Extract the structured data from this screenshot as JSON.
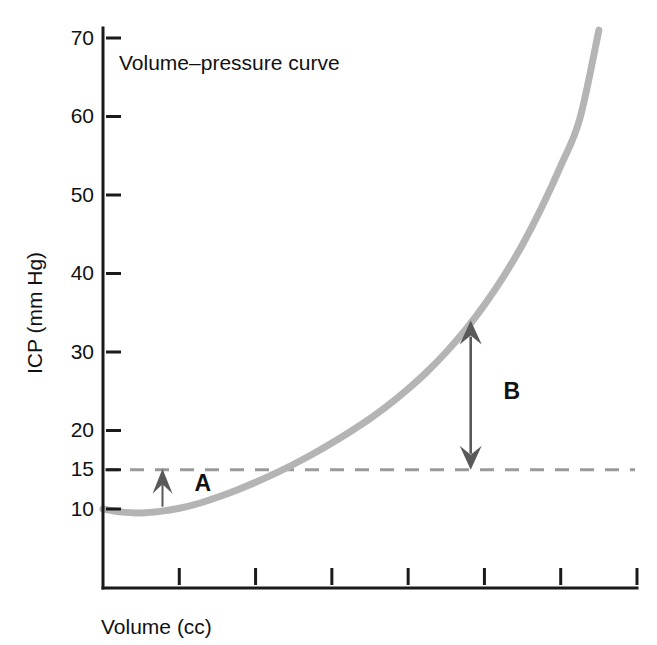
{
  "chart_data": {
    "type": "line",
    "title": "Volume–pressure curve",
    "xlabel": "Volume (cc)",
    "ylabel": "ICP (mm Hg)",
    "grid": false,
    "legend": "none",
    "xlim": [
      0,
      7
    ],
    "ylim": [
      5,
      72
    ],
    "ytick_labels": [
      "70",
      "60",
      "50",
      "40",
      "30",
      "20",
      "15",
      "10"
    ],
    "ytick_values": [
      70,
      60,
      50,
      40,
      30,
      20,
      15,
      10
    ],
    "xtick_labels": [
      "",
      "",
      "",
      "",
      "",
      "",
      ""
    ],
    "xtick_values": [
      1,
      2,
      3,
      4,
      5,
      6,
      7
    ],
    "series": [
      {
        "name": "Volume-pressure curve",
        "color": "#b4b4b4",
        "linewidth": 7,
        "x": [
          0.0,
          0.25,
          0.5,
          0.75,
          1.0,
          1.25,
          1.5,
          1.75,
          2.0,
          2.25,
          2.5,
          2.75,
          3.0,
          3.25,
          3.5,
          3.75,
          4.0,
          4.25,
          4.5,
          4.75,
          5.0,
          5.25,
          5.5,
          5.75,
          6.0,
          6.25,
          6.5
        ],
        "y": [
          10.0,
          9.6,
          9.5,
          9.7,
          10.1,
          10.7,
          11.5,
          12.4,
          13.4,
          14.5,
          15.7,
          17.0,
          18.4,
          19.9,
          21.5,
          23.3,
          25.3,
          27.5,
          30.0,
          32.8,
          36.0,
          39.6,
          43.7,
          48.4,
          53.7,
          59.7,
          71.0
        ]
      }
    ],
    "threshold": {
      "name": "normal-pressure-threshold",
      "value": 15,
      "style": "dashed",
      "color": "#9a9a9a",
      "linewidth": 3,
      "dash": "14,11"
    },
    "annotations": [
      {
        "label": "A",
        "name": "annotation-a",
        "type": "arrow-up",
        "x": 0.78,
        "y_from": 10.3,
        "y_to": 15.0,
        "label_x": 1.2,
        "label_y": 12.3,
        "color": "#595959"
      },
      {
        "label": "B",
        "name": "annotation-b",
        "type": "arrow-double-vertical",
        "x": 4.82,
        "y_from": 15.0,
        "y_to": 34.0,
        "label_x": 5.25,
        "label_y": 24.0,
        "color": "#595959"
      }
    ]
  },
  "figure": {
    "background": "#ffffff",
    "axis_color": "#1a1a1a",
    "text_color": "#111111"
  }
}
